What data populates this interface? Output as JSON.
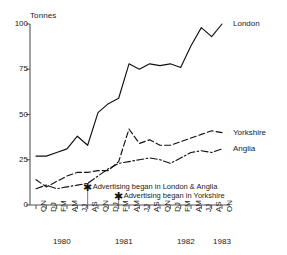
{
  "chart_data": {
    "type": "line",
    "title": "",
    "xlabel": "",
    "ylabel": "Tonnes",
    "ylim": [
      0,
      100
    ],
    "yticks": [
      0,
      25,
      50,
      75,
      100
    ],
    "ytick_labels": [
      "0",
      "25",
      "50",
      "75",
      "100"
    ],
    "grid": false,
    "legend_position": "right-inline",
    "categories": [
      "ON",
      "DJ",
      "FM",
      "AM",
      "JJ",
      "AS",
      "ON",
      "DJ",
      "FM",
      "AM",
      "JJ",
      "AS",
      "ON",
      "DJ",
      "FM",
      "AM",
      "JJ",
      "AS",
      "ON"
    ],
    "year_groups": [
      {
        "label": "1980",
        "start_index": 0,
        "end_index": 5
      },
      {
        "label": "1981",
        "start_index": 6,
        "end_index": 11
      },
      {
        "label": "1982",
        "start_index": 12,
        "end_index": 17
      },
      {
        "label": "1983",
        "start_index": 18,
        "end_index": 18
      }
    ],
    "year_labels": [
      "1980",
      "1981",
      "1982",
      "1983"
    ],
    "series": [
      {
        "name": "London",
        "line_style": "solid",
        "values": [
          27,
          27,
          29,
          31,
          38,
          33,
          51,
          56,
          59,
          78,
          75,
          78,
          77,
          78,
          76,
          88,
          98,
          93,
          100
        ]
      },
      {
        "name": "Yorkshire",
        "line_style": "dashed",
        "values": [
          14,
          10,
          13,
          16,
          18,
          18,
          19,
          19,
          24,
          42,
          34,
          36,
          33,
          33,
          35,
          37,
          39,
          41,
          40
        ]
      },
      {
        "name": "Anglia",
        "line_style": "dashdot",
        "values": [
          9,
          11,
          9,
          10,
          11,
          12,
          16,
          20,
          23,
          24,
          25,
          26,
          25,
          23,
          26,
          29,
          30,
          29,
          31
        ]
      }
    ],
    "annotations": [
      {
        "text": "Advertising began in London & Anglia",
        "marker": "asterisk",
        "marker_index": 5,
        "marker_value": 10
      },
      {
        "text": "Advertising began in Yorkshire",
        "marker": "asterisk",
        "marker_index": 8,
        "marker_value": 5
      }
    ]
  }
}
